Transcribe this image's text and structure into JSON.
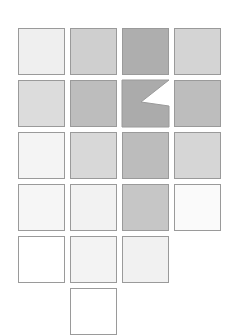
{
  "figure": {
    "kind": "grayscale-tile-grid",
    "background_color": "#ffffff",
    "border_color": "#9a9a9a",
    "columns": 4,
    "rows": 6,
    "tile_size": 47,
    "gap": 5,
    "origin_x": 18,
    "origin_y": 28,
    "tile_label": "tile",
    "notch_label": "notched-tile"
  },
  "grid": {
    "rows": [
      {
        "index": 1,
        "cells": [
          {
            "col": 1,
            "fill": "#efefef",
            "shape": "square",
            "tone": "very-light"
          },
          {
            "col": 2,
            "fill": "#cfcfcf",
            "shape": "square",
            "tone": "medium-light"
          },
          {
            "col": 3,
            "fill": "#aeaeae",
            "shape": "square",
            "tone": "dark"
          },
          {
            "col": 4,
            "fill": "#d4d4d4",
            "shape": "square",
            "tone": "medium-light"
          }
        ]
      },
      {
        "index": 2,
        "cells": [
          {
            "col": 1,
            "fill": "#dcdcdc",
            "shape": "square",
            "tone": "light-medium"
          },
          {
            "col": 2,
            "fill": "#bdbdbd",
            "shape": "square",
            "tone": "medium"
          },
          {
            "col": 3,
            "fill": "#ababab",
            "shape": "notched",
            "tone": "dark"
          },
          {
            "col": 4,
            "fill": "#bdbdbd",
            "shape": "square",
            "tone": "medium"
          }
        ]
      },
      {
        "index": 3,
        "cells": [
          {
            "col": 1,
            "fill": "#f4f4f4",
            "shape": "square",
            "tone": "very-light"
          },
          {
            "col": 2,
            "fill": "#d8d8d8",
            "shape": "square",
            "tone": "light-medium"
          },
          {
            "col": 3,
            "fill": "#bcbcbc",
            "shape": "square",
            "tone": "medium-dark"
          },
          {
            "col": 4,
            "fill": "#d6d6d6",
            "shape": "square",
            "tone": "light-medium"
          }
        ]
      },
      {
        "index": 4,
        "cells": [
          {
            "col": 1,
            "fill": "#f6f6f6",
            "shape": "square",
            "tone": "very-light"
          },
          {
            "col": 2,
            "fill": "#f2f2f2",
            "shape": "square",
            "tone": "very-light"
          },
          {
            "col": 3,
            "fill": "#c6c6c6",
            "shape": "square",
            "tone": "medium"
          },
          {
            "col": 4,
            "fill": "#fafafa",
            "shape": "square",
            "tone": "near-white"
          }
        ]
      },
      {
        "index": 5,
        "cells": [
          {
            "col": 1,
            "fill": "#ffffff",
            "shape": "square",
            "tone": "white"
          },
          {
            "col": 2,
            "fill": "#f3f3f3",
            "shape": "square",
            "tone": "very-light"
          },
          {
            "col": 3,
            "fill": "#f1f1f1",
            "shape": "square",
            "tone": "very-light"
          }
        ]
      },
      {
        "index": 6,
        "cells": [
          {
            "col": 2,
            "fill": "#ffffff",
            "shape": "square",
            "tone": "white",
            "clipped": true
          }
        ]
      }
    ]
  },
  "notch": {
    "description": "wedge cut from right edge forming a Z / less-than silhouette",
    "outline_points": "0,0 47,0 19,22 47,26 47,47 0,47"
  }
}
